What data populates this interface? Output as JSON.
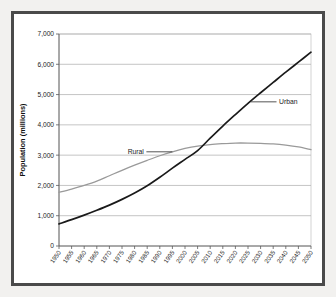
{
  "figure": {
    "frame_color": "#4a4a4a",
    "background_color": "#f2f1ef",
    "plot_background": "#ffffff"
  },
  "chart_data": {
    "type": "line",
    "title": "",
    "subtitle": "",
    "xlabel": "",
    "ylabel": "Population (millions)",
    "x": [
      1950,
      1955,
      1960,
      1965,
      1970,
      1975,
      1980,
      1985,
      1990,
      1995,
      2000,
      2005,
      2010,
      2015,
      2020,
      2025,
      2030,
      2035,
      2040,
      2045,
      2050
    ],
    "categories": [
      "1950",
      "1955",
      "1960",
      "1965",
      "1970",
      "1975",
      "1980",
      "1985",
      "1990",
      "1995",
      "2000",
      "2005",
      "2010",
      "2015",
      "2020",
      "2025",
      "2030",
      "2035",
      "2040",
      "2045",
      "2050"
    ],
    "series": [
      {
        "name": "Urban",
        "color": "#1a1a1a",
        "line_width": 1.7,
        "values": [
          730,
          870,
          1020,
          1180,
          1350,
          1540,
          1750,
          1990,
          2270,
          2570,
          2860,
          3150,
          3560,
          3960,
          4340,
          4710,
          5060,
          5400,
          5740,
          6070,
          6400
        ]
      },
      {
        "name": "Rural",
        "color": "#9a9a9a",
        "line_width": 1.3,
        "values": [
          1770,
          1880,
          2000,
          2140,
          2320,
          2500,
          2670,
          2830,
          2980,
          3110,
          3220,
          3300,
          3350,
          3380,
          3400,
          3400,
          3390,
          3370,
          3330,
          3270,
          3180
        ]
      }
    ],
    "ylim": [
      0,
      7000
    ],
    "ytick_values": [
      0,
      1000,
      2000,
      3000,
      4000,
      5000,
      6000,
      7000
    ],
    "ytick_labels": [
      "0",
      "1,000",
      "2,000",
      "3,000",
      "4,000",
      "5,000",
      "6,000",
      "7,000"
    ],
    "xlim": [
      1950,
      2050
    ],
    "grid": {
      "horizontal": true,
      "vertical": false,
      "color": "#9c9c9c"
    },
    "legend": {
      "position": "inline-annotation",
      "entries": [
        "Rural",
        "Urban"
      ]
    },
    "annotations": [
      {
        "label": "Rural",
        "target_year": 1995,
        "target_value": 3110,
        "side": "left"
      },
      {
        "label": "Urban",
        "target_year": 2026,
        "target_value": 4760,
        "side": "right"
      }
    ]
  }
}
